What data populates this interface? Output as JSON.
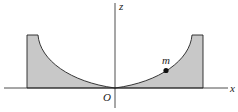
{
  "diagram": {
    "type": "physics-figure",
    "labels": {
      "z_axis": "z",
      "x_axis": "x",
      "origin": "O",
      "mass": "m"
    },
    "colors": {
      "fill": "#c8c8c8",
      "stroke": "#222222"
    }
  }
}
